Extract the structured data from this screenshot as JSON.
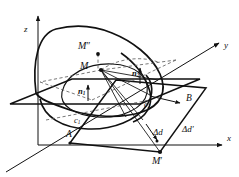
{
  "figure": {
    "background_color": "#ffffff",
    "stroke_color": "#111111",
    "dash_color": "#555555",
    "axes": [
      {
        "name": "z-axis",
        "label": "z",
        "x": 27,
        "y": 30,
        "direction": "up"
      },
      {
        "name": "y-axis",
        "label": "y",
        "x": 224,
        "y": 47,
        "direction": "up-right"
      },
      {
        "name": "x-axis",
        "label": "x",
        "x": 227,
        "y": 140,
        "direction": "right"
      }
    ],
    "points": [
      {
        "name": "M-double-prime",
        "label": "M",
        "prime": "″",
        "dot_x": 98,
        "dot_y": 54,
        "label_x": 78,
        "label_y": 42
      },
      {
        "name": "M",
        "label": "M",
        "prime": "",
        "dot_x": 101,
        "dot_y": 70,
        "label_x": 80,
        "label_y": 62
      },
      {
        "name": "M-prime",
        "label": "M",
        "prime": "′",
        "dot_x": 160,
        "dot_y": 152,
        "label_x": 152,
        "label_y": 157
      },
      {
        "name": "point-A",
        "label": "A",
        "prime": "",
        "dot_x": 70,
        "dot_y": 143,
        "label_x": 67,
        "label_y": 132
      },
      {
        "name": "point-B",
        "label": "B",
        "prime": "",
        "dot_x": 0,
        "dot_y": 0,
        "label_x": 186,
        "label_y": 96
      },
      {
        "name": "point-c1",
        "label": "c",
        "prime": "",
        "sub": "1",
        "dot_x": 0,
        "dot_y": 0,
        "label_x": 76,
        "label_y": 117
      },
      {
        "name": "point-c2",
        "label": "c",
        "prime": "",
        "sub": "2",
        "dot_x": 0,
        "dot_y": 0,
        "label_x": 146,
        "label_y": 101
      }
    ],
    "vectors": [
      {
        "name": "normal-n1",
        "label": "n",
        "sub": "1",
        "label_x": 79,
        "label_y": 88
      },
      {
        "name": "normal-n2",
        "label": "n",
        "sub": "2",
        "label_x": 133,
        "label_y": 70
      }
    ],
    "measures": [
      {
        "name": "delta-d",
        "label": "Δd",
        "label_x": 153,
        "label_y": 129
      },
      {
        "name": "delta-d-prime",
        "label": "Δd′",
        "label_x": 183,
        "label_y": 126
      }
    ]
  }
}
